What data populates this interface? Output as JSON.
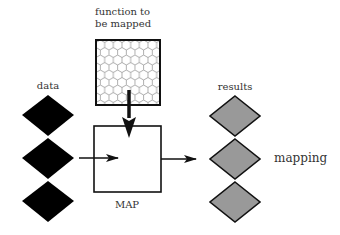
{
  "labels": {
    "function": "function to",
    "function2": "be mapped",
    "data": "data",
    "results": "results",
    "map": "MAP",
    "mapping": "mapping"
  },
  "colors": {
    "data_fill": "#000000",
    "result_fill": "#999999",
    "stroke": "#111111",
    "hex_stroke": "#888888"
  },
  "diagram": {
    "nodes": [
      {
        "id": "function",
        "label": "function to be mapped",
        "shape": "hex-grid square"
      },
      {
        "id": "map",
        "label": "MAP",
        "shape": "square"
      },
      {
        "id": "data",
        "label": "data",
        "shape": "3 black diamonds"
      },
      {
        "id": "results",
        "label": "results",
        "shape": "3 gray diamonds"
      }
    ],
    "edges": [
      {
        "from": "function",
        "to": "map"
      },
      {
        "from": "data",
        "to": "map"
      },
      {
        "from": "map",
        "to": "results"
      }
    ],
    "caption": "mapping"
  }
}
